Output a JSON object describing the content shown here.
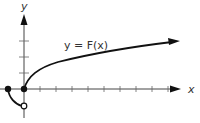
{
  "figure": {
    "function_label": "y = F(x)",
    "x_axis_label": "x",
    "y_axis_label": "y",
    "colors": {
      "axis": "#444444",
      "curve": "#111111",
      "text": "#333333",
      "background": "#ffffff"
    },
    "x_ticks_positive_count": 9,
    "y_ticks_positive_count": 3,
    "points": [
      {
        "name": "left-endpoint",
        "type": "closed",
        "x": -1,
        "y": 0
      },
      {
        "name": "origin-point",
        "type": "closed",
        "x": 0,
        "y": 0
      },
      {
        "name": "open-endpoint",
        "type": "open",
        "x": 0,
        "y": -1
      }
    ],
    "pieces": [
      {
        "name": "left-piece",
        "description": "curved arc from (-1,0) down to open circle at (0,-1)"
      },
      {
        "name": "right-piece",
        "description": "square-root-like curve from (0,0) rising to the right with arrow"
      }
    ]
  }
}
